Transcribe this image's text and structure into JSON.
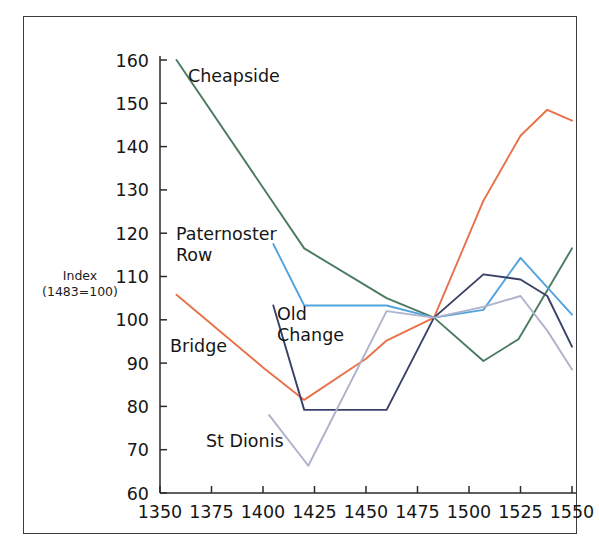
{
  "figure": {
    "background_color": "#ffffff",
    "frame_color": "#3c3c3c"
  },
  "axis": {
    "y_label_line1": "Index",
    "y_label_line2": "(1483=100)",
    "y_ticks": [
      "60",
      "70",
      "80",
      "90",
      "100",
      "110",
      "120",
      "130",
      "140",
      "150",
      "160"
    ],
    "x_ticks": [
      "1350",
      "1375",
      "1400",
      "1425",
      "1450",
      "1475",
      "1500",
      "1525",
      "1550"
    ]
  },
  "series_labels": [
    {
      "name": "cheapside",
      "text": "Cheapside"
    },
    {
      "name": "paternoster-row-line1",
      "text": "Paternoster"
    },
    {
      "name": "paternoster-row-line2",
      "text": "Row"
    },
    {
      "name": "bridge",
      "text": "Bridge"
    },
    {
      "name": "old-change-line1",
      "text": "Old"
    },
    {
      "name": "old-change-line2",
      "text": "Change"
    },
    {
      "name": "st-dionis",
      "text": "St Dionis"
    }
  ],
  "chart_data": {
    "type": "line",
    "title": "",
    "xlabel": "",
    "ylabel": "Index (1483=100)",
    "xlim": [
      1350,
      1550
    ],
    "ylim": [
      60,
      160
    ],
    "grid": false,
    "legend": "inline-labels",
    "x_ticks": [
      1350,
      1375,
      1400,
      1425,
      1450,
      1475,
      1500,
      1525,
      1550
    ],
    "y_ticks": [
      60,
      70,
      80,
      90,
      100,
      110,
      120,
      130,
      140,
      150,
      160
    ],
    "series": [
      {
        "name": "Cheapside",
        "color": "#4a7a5f",
        "points": [
          [
            1358,
            160.0
          ],
          [
            1420,
            116.5
          ],
          [
            1460,
            105.0
          ],
          [
            1483,
            100.5
          ],
          [
            1507,
            90.5
          ],
          [
            1524,
            95.5
          ],
          [
            1550,
            116.5
          ]
        ]
      },
      {
        "name": "Paternoster Row",
        "color": "#53a3dd",
        "points": [
          [
            1405,
            117.5
          ],
          [
            1420,
            103.3
          ],
          [
            1460,
            103.3
          ],
          [
            1483,
            100.5
          ],
          [
            1507,
            102.3
          ],
          [
            1525,
            114.3
          ],
          [
            1550,
            101.2
          ]
        ]
      },
      {
        "name": "Bridge",
        "color": "#e8714a",
        "points": [
          [
            1358,
            105.8
          ],
          [
            1400,
            89.0
          ],
          [
            1420,
            81.5
          ],
          [
            1450,
            91.0
          ],
          [
            1460,
            95.2
          ],
          [
            1483,
            100.5
          ],
          [
            1507,
            127.5
          ],
          [
            1525,
            142.5
          ],
          [
            1538,
            148.5
          ],
          [
            1550,
            146.0
          ]
        ]
      },
      {
        "name": "Old Change",
        "color": "#3a4168",
        "points": [
          [
            1405,
            103.3
          ],
          [
            1420,
            79.2
          ],
          [
            1460,
            79.2
          ],
          [
            1483,
            100.5
          ],
          [
            1507,
            110.5
          ],
          [
            1525,
            109.3
          ],
          [
            1538,
            105.5
          ],
          [
            1550,
            93.8
          ]
        ]
      },
      {
        "name": "St Dionis",
        "color": "#aeb2cc",
        "points": [
          [
            1403,
            78.0
          ],
          [
            1422,
            66.3
          ],
          [
            1460,
            102.0
          ],
          [
            1483,
            100.5
          ],
          [
            1507,
            103.0
          ],
          [
            1525,
            105.5
          ],
          [
            1538,
            97.5
          ],
          [
            1550,
            88.5
          ]
        ]
      }
    ]
  }
}
